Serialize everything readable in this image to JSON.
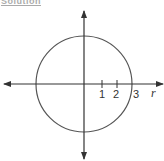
{
  "heading": {
    "text": "Solution"
  },
  "diagram": {
    "type": "polar-plot",
    "colors": {
      "axis": "#333333",
      "curve": "#555555",
      "background": "#ffffff"
    },
    "center_px": [
      84,
      84
    ],
    "radius_px": 48,
    "ticks": [
      {
        "label": "1",
        "x": 102
      },
      {
        "label": "2",
        "x": 117
      },
      {
        "label": "3",
        "x": 132
      }
    ],
    "axis_label": "r"
  },
  "labels": {
    "tick1": "1",
    "tick2": "2",
    "tick3": "3",
    "r": "r"
  }
}
